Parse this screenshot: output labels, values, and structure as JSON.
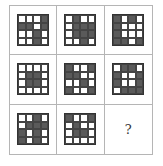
{
  "puzzle": {
    "rows": 3,
    "cols": 3,
    "grid_size": 4,
    "colors": {
      "dark": "#5a5a5a",
      "light": "#ffffff",
      "border": "#b5b5b5"
    },
    "panels": [
      {
        "pattern": [
          [
            0,
            0,
            0,
            1
          ],
          [
            1,
            1,
            0,
            1
          ],
          [
            0,
            0,
            1,
            0
          ],
          [
            0,
            0,
            1,
            0
          ]
        ]
      },
      {
        "pattern": [
          [
            0,
            1,
            0,
            0
          ],
          [
            0,
            1,
            1,
            1
          ],
          [
            0,
            1,
            1,
            1
          ],
          [
            0,
            0,
            1,
            0
          ]
        ]
      },
      {
        "pattern": [
          [
            1,
            0,
            1,
            0
          ],
          [
            1,
            0,
            0,
            0
          ],
          [
            1,
            0,
            0,
            0
          ],
          [
            1,
            1,
            0,
            1
          ]
        ]
      },
      {
        "pattern": [
          [
            0,
            0,
            0,
            0
          ],
          [
            0,
            1,
            1,
            0
          ],
          [
            0,
            1,
            1,
            0
          ],
          [
            0,
            0,
            0,
            0
          ]
        ]
      },
      {
        "pattern": [
          [
            1,
            0,
            0,
            1
          ],
          [
            1,
            1,
            0,
            0
          ],
          [
            0,
            0,
            1,
            0
          ],
          [
            1,
            0,
            0,
            1
          ]
        ]
      },
      {
        "pattern": [
          [
            0,
            1,
            1,
            0
          ],
          [
            1,
            0,
            0,
            1
          ],
          [
            1,
            0,
            0,
            1
          ],
          [
            0,
            1,
            1,
            1
          ]
        ]
      },
      {
        "pattern": [
          [
            0,
            0,
            1,
            0
          ],
          [
            0,
            1,
            1,
            1
          ],
          [
            1,
            0,
            1,
            0
          ],
          [
            1,
            0,
            1,
            0
          ]
        ]
      },
      {
        "pattern": [
          [
            1,
            0,
            0,
            1
          ],
          [
            0,
            1,
            0,
            0
          ],
          [
            0,
            1,
            1,
            0
          ],
          [
            0,
            0,
            0,
            0
          ]
        ]
      },
      {
        "missing": true,
        "label": "?"
      }
    ]
  }
}
